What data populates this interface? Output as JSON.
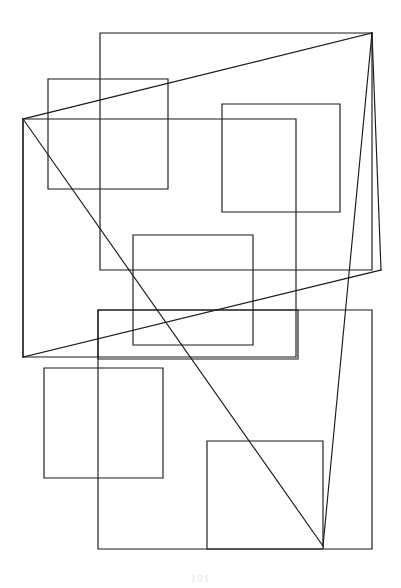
{
  "page": {
    "page_number": "101",
    "background_color": "#ffffff",
    "stroke_color": "#1a1a1a",
    "page_number_color": "#e2e2e2",
    "width": 401,
    "height": 588
  },
  "figure": {
    "type": "line-drawing",
    "stroke_width": 1.15,
    "rectangle_count": 9,
    "line_count": 6,
    "rectangles": [
      {
        "name": "outer-top-rectangle",
        "x": 100,
        "y": 33,
        "width": 272,
        "height": 237
      },
      {
        "name": "upper-left-rectangle",
        "x": 48,
        "y": 79,
        "width": 120,
        "height": 110
      },
      {
        "name": "left-wide-rectangle",
        "x": 23,
        "y": 119,
        "width": 273,
        "height": 238
      },
      {
        "name": "upper-right-rectangle",
        "x": 222,
        "y": 104,
        "width": 118,
        "height": 108
      },
      {
        "name": "center-rectangle",
        "x": 133,
        "y": 235,
        "width": 120,
        "height": 110
      },
      {
        "name": "mid-wide-rectangle",
        "x": 98,
        "y": 310,
        "width": 200,
        "height": 49
      },
      {
        "name": "lower-left-rectangle",
        "x": 44,
        "y": 368,
        "width": 119,
        "height": 110
      },
      {
        "name": "bottom-wide-rectangle",
        "x": 98,
        "y": 310,
        "width": 274,
        "height": 239
      },
      {
        "name": "bottom-right-rectangle",
        "x": 207,
        "y": 441,
        "width": 116,
        "height": 108
      }
    ],
    "vertices": [
      {
        "name": "apex-top-right",
        "x": 372,
        "y": 33
      },
      {
        "name": "node-left-upper",
        "x": 23,
        "y": 119
      },
      {
        "name": "node-left-lower",
        "x": 23,
        "y": 357
      },
      {
        "name": "node-right-mid",
        "x": 381,
        "y": 270
      },
      {
        "name": "node-bottom",
        "x": 323,
        "y": 546
      }
    ],
    "lines": [
      {
        "name": "line-apex-to-left-upper",
        "x1": 372,
        "y1": 33,
        "x2": 23,
        "y2": 119
      },
      {
        "name": "line-apex-to-right-mid",
        "x1": 372,
        "y1": 33,
        "x2": 381,
        "y2": 270
      },
      {
        "name": "line-apex-to-bottom",
        "x1": 372,
        "y1": 33,
        "x2": 323,
        "y2": 546
      },
      {
        "name": "line-left-upper-to-bottom",
        "x1": 23,
        "y1": 119,
        "x2": 323,
        "y2": 546
      },
      {
        "name": "line-left-upper-to-lower",
        "x1": 23,
        "y1": 119,
        "x2": 23,
        "y2": 357
      },
      {
        "name": "line-left-lower-to-right",
        "x1": 23,
        "y1": 357,
        "x2": 381,
        "y2": 270
      }
    ]
  }
}
